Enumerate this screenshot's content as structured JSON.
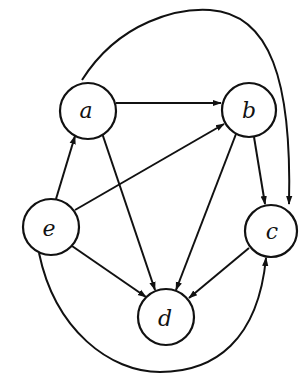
{
  "diagram": {
    "type": "directed-graph",
    "nodes": [
      {
        "id": "a",
        "label": "a",
        "cx": 88,
        "cy": 111,
        "r": 28
      },
      {
        "id": "b",
        "label": "b",
        "cx": 249,
        "cy": 110,
        "r": 27
      },
      {
        "id": "c",
        "label": "c",
        "cx": 271,
        "cy": 231,
        "r": 26
      },
      {
        "id": "d",
        "label": "d",
        "cx": 166,
        "cy": 317,
        "r": 28
      },
      {
        "id": "e",
        "label": "e",
        "cx": 51,
        "cy": 227,
        "r": 28
      }
    ],
    "edges": [
      {
        "from": "a",
        "to": "b"
      },
      {
        "from": "a",
        "to": "d"
      },
      {
        "from": "a",
        "to": "c",
        "curved": "top-arc"
      },
      {
        "from": "b",
        "to": "c"
      },
      {
        "from": "b",
        "to": "d"
      },
      {
        "from": "e",
        "to": "a"
      },
      {
        "from": "e",
        "to": "b"
      },
      {
        "from": "e",
        "to": "d"
      },
      {
        "from": "c",
        "to": "d"
      },
      {
        "from": "e",
        "to": "c",
        "curved": "bottom-arc"
      }
    ]
  }
}
